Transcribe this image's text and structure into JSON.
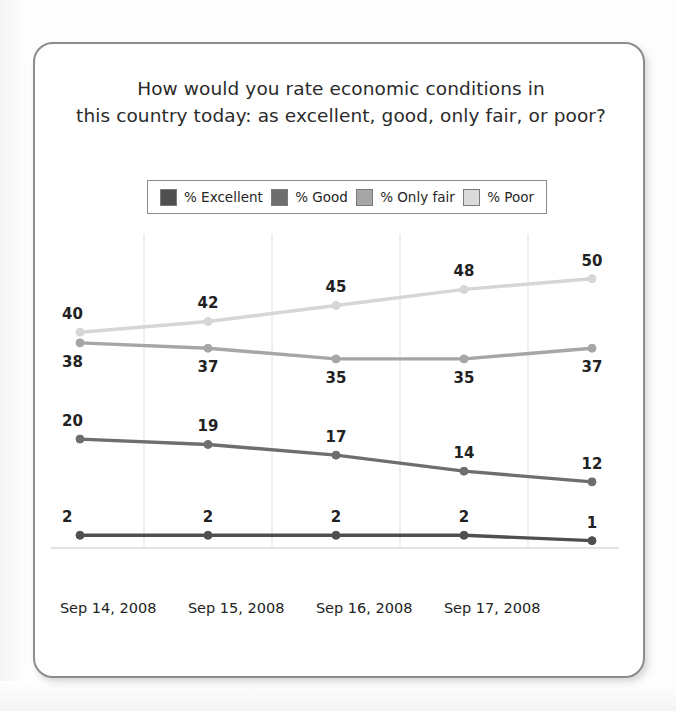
{
  "chart_data": {
    "type": "line",
    "title": "How would you rate economic conditions in this country today: as excellent, good, only fair, or poor?",
    "title_lines": [
      "How would you rate economic conditions in",
      "this country today: as excellent, good, only fair, or poor?"
    ],
    "xlabel": "",
    "ylabel": "",
    "ylim": [
      0,
      55
    ],
    "grid": true,
    "grid_axis": "x",
    "legend_position": "top-center",
    "categories": [
      "Sep 14, 2008",
      "Sep 15, 2008",
      "Sep 16, 2008",
      "Sep 17, 2008",
      ""
    ],
    "tick_labels": [
      "Sep 14, 2008",
      "Sep 15, 2008",
      "Sep 16, 2008",
      "Sep 17, 2008"
    ],
    "series": [
      {
        "name": "% Poor",
        "color": "#d6d6d6",
        "values": [
          40,
          42,
          45,
          48,
          50
        ],
        "label_positions": [
          "above",
          "above",
          "above",
          "above",
          "above"
        ]
      },
      {
        "name": "% Only fair",
        "color": "#a6a6a6",
        "values": [
          38,
          37,
          35,
          35,
          37
        ],
        "label_positions": [
          "below",
          "below",
          "below",
          "below",
          "below"
        ]
      },
      {
        "name": "% Good",
        "color": "#6e6e6e",
        "values": [
          20,
          19,
          17,
          14,
          12
        ],
        "label_positions": [
          "above",
          "above",
          "above",
          "above",
          "above"
        ]
      },
      {
        "name": "% Excellent",
        "color": "#4f4f4f",
        "values": [
          2,
          2,
          2,
          2,
          1
        ],
        "label_positions": [
          "above",
          "above",
          "above",
          "above",
          "above"
        ]
      }
    ]
  },
  "legend": {
    "items": [
      {
        "label": "% Excellent",
        "color": "#4f4f4f"
      },
      {
        "label": "% Good",
        "color": "#6e6e6e"
      },
      {
        "label": "% Only fair",
        "color": "#a6a6a6"
      },
      {
        "label": "% Poor",
        "color": "#dadada"
      }
    ]
  },
  "colors": {
    "card_border": "#8c8c8c",
    "card_background": "#ffffff",
    "page_background": "#fdfdfd",
    "gridline": "#e4e4e4",
    "axis_line": "#d8d8d8",
    "label_text": "#222222",
    "title_text": "#2b2b2b"
  }
}
